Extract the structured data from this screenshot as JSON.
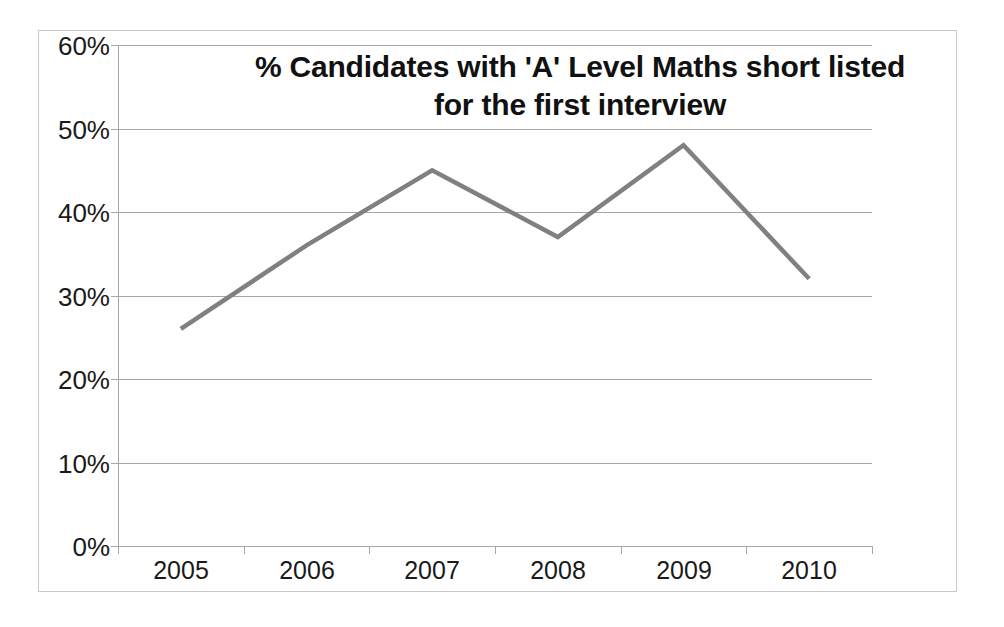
{
  "chart_data": {
    "type": "line",
    "title": "% Candidates with 'A' Level Maths short listed for the first interview",
    "title_line1": "% Candidates with 'A' Level Maths short listed",
    "title_line2": "for the first interview",
    "xlabel": "",
    "ylabel": "",
    "categories": [
      "2005",
      "2006",
      "2007",
      "2008",
      "2009",
      "2010"
    ],
    "values": [
      26,
      36,
      45,
      37,
      48,
      32
    ],
    "series": [
      {
        "name": "% Candidates with 'A' Level Maths short listed for the first interview",
        "values": [
          26,
          36,
          45,
          37,
          48,
          32
        ],
        "color": "#808080"
      }
    ],
    "ylim": [
      0,
      60
    ],
    "ytick_values": [
      0,
      10,
      20,
      30,
      40,
      50,
      60
    ],
    "ytick_labels": [
      "0%",
      "10%",
      "20%",
      "30%",
      "40%",
      "50%",
      "60%"
    ],
    "grid": true,
    "grid_axis": "y",
    "legend": false,
    "legend_position": "none",
    "value_format": "percent"
  },
  "colors": {
    "series_line": "#808080",
    "gridline": "#a6a6a6",
    "axis": "#a6a6a6",
    "frame_border": "#c9c9c9",
    "text": "#1a1a1a",
    "title_text": "#111111",
    "background": "#ffffff"
  }
}
